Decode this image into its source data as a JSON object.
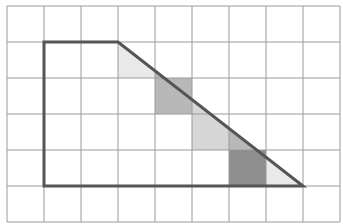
{
  "diagram": {
    "type": "grid-shape",
    "grid": {
      "columns": 9,
      "rows": 6,
      "origin_x": 7,
      "origin_y": 6,
      "cell_width": 37,
      "cell_height": 36,
      "line_color": "#9a9a9a"
    },
    "outline": {
      "description": "trapezoid (right trapezoid with slanted right side)",
      "points_grid": [
        [
          1,
          1
        ],
        [
          3,
          1
        ],
        [
          8,
          5
        ],
        [
          1,
          5
        ]
      ],
      "stroke_color": "#555555",
      "stroke_width": 3
    },
    "shaded_regions": [
      {
        "label": "col3-row1-below-diagonal",
        "fill": "#e9e9e9"
      },
      {
        "label": "col4-under-diagonal",
        "fill": "#b8b8b8"
      },
      {
        "label": "col5-under-diagonal",
        "fill": "#d6d6d6"
      },
      {
        "label": "col6-upper-under-diagonal",
        "fill": "#b8b8b8"
      },
      {
        "label": "col6-lower-cell",
        "fill": "#8e8e8e"
      },
      {
        "label": "col7-under-diagonal",
        "fill": "#e9e9e9"
      }
    ]
  }
}
